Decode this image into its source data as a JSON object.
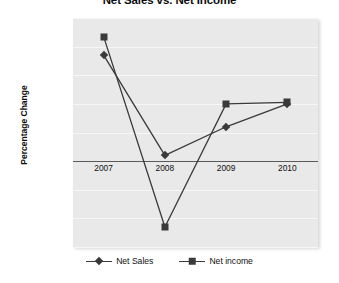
{
  "chart_data": {
    "type": "line",
    "title": "Net Sales vs. Net Income",
    "xlabel": "",
    "ylabel": "Percentage Change",
    "categories": [
      "2007",
      "2008",
      "2009",
      "2010"
    ],
    "series": [
      {
        "name": "Net Sales",
        "marker": "diamond",
        "values": [
          27.0,
          -8.0,
          2.0,
          10.0
        ]
      },
      {
        "name": "Net income",
        "marker": "square",
        "values": [
          33.5,
          -33.0,
          10.0,
          10.5
        ]
      }
    ],
    "ylim": [
      -40,
      40
    ],
    "ytick_values": [
      40,
      30,
      20,
      10,
      0,
      -10,
      -20,
      -30,
      -40
    ],
    "ytick_labels": [
      "40.0%",
      "30.0%",
      "20.0%",
      "10.0%",
      "0.00%",
      "-10.00%",
      "-20.00%",
      "-30.00%",
      "-40.00%"
    ],
    "category_axis_at": -10,
    "grid": true,
    "legend_position": "bottom",
    "colors": {
      "plot_background": "#e9e9e9",
      "gridline": "#f7f7f7",
      "series_line": "#3a3a3a",
      "axis_line": "#5a5a5a",
      "text": "#101010"
    }
  }
}
